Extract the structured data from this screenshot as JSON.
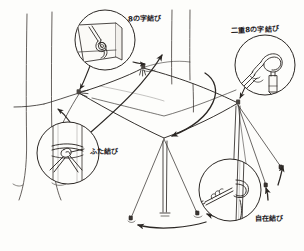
{
  "illustration": {
    "title": "Tarp pitching knots diagram",
    "style": "hand-drawn pen sketch",
    "background_color": "#fdfdfb",
    "ink_color": "#2b2724",
    "subject": "square tarp strung between two trees and two poles with guy lines and stakes"
  },
  "labels": {
    "figure_eight": "8の字結び",
    "double_figure_eight": "二重8の字結び",
    "two_half_hitches": "ふた結び",
    "taut_line_hitch": "自在結び"
  },
  "callouts": [
    {
      "id": "fig8",
      "label": "8の字結び",
      "position": "top-left",
      "depicts": "figure-eight stopper knot through tarp corner grommet",
      "center_x": 105,
      "center_y": 40,
      "radius": 30
    },
    {
      "id": "dblfig8",
      "label": "二重8の字結び",
      "position": "top-right",
      "depicts": "double figure-eight loop over tent stake",
      "center_x": 265,
      "center_y": 65,
      "radius": 30
    },
    {
      "id": "twohitch",
      "label": "ふた結び",
      "position": "left",
      "depicts": "rope tied with two half hitches around tree trunk",
      "center_x": 68,
      "center_y": 153,
      "radius": 31
    },
    {
      "id": "tautline",
      "label": "自在結び",
      "position": "bottom-right",
      "depicts": "taut-line hitch adjuster on guy line at stake",
      "center_x": 230,
      "center_y": 190,
      "radius": 31
    }
  ],
  "scene_elements": [
    "left tree trunk",
    "second tree trunk",
    "background tree trunks",
    "square tarp canopy",
    "center pole",
    "right pole",
    "guy lines",
    "ground stakes",
    "pointer arrows",
    "curved arrows"
  ]
}
